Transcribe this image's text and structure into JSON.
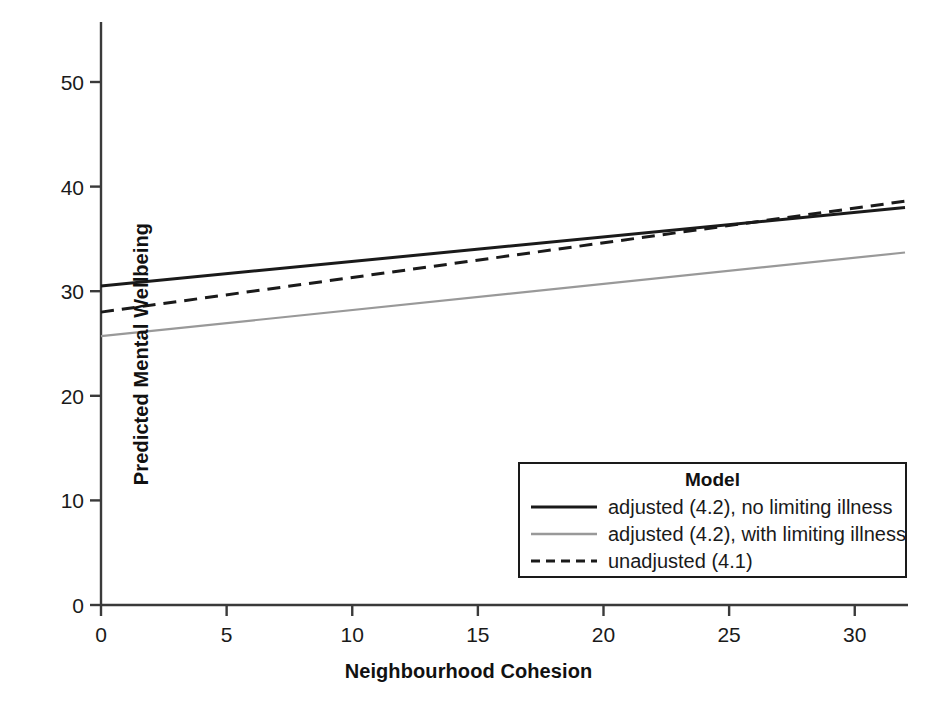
{
  "chart_data": {
    "type": "line",
    "title": "",
    "xlabel": "Neighbourhood Cohesion",
    "ylabel": "Predicted Mental Wellbeing",
    "xlim": [
      0,
      32
    ],
    "ylim": [
      0,
      55
    ],
    "xticks": [
      "0",
      "5",
      "10",
      "15",
      "20",
      "25",
      "30"
    ],
    "xtick_values": [
      0,
      5,
      10,
      15,
      20,
      25,
      30
    ],
    "yticks": [
      "0",
      "10",
      "20",
      "30",
      "40",
      "50"
    ],
    "ytick_values": [
      0,
      10,
      20,
      30,
      40,
      50
    ],
    "grid": false,
    "legend_position": "lower right",
    "legend_title": "Model",
    "series": [
      {
        "name": "adjusted (4.2), no limiting illness",
        "style": "solid",
        "color": "#1a1a1a",
        "width": 3,
        "x": [
          0,
          32
        ],
        "values": [
          30.5,
          38.0
        ]
      },
      {
        "name": "adjusted (4.2), with limiting illness",
        "style": "solid",
        "color": "#999999",
        "width": 2.2,
        "x": [
          0,
          32
        ],
        "values": [
          25.7,
          33.7
        ]
      },
      {
        "name": "unadjusted (4.1)",
        "style": "dashed",
        "color": "#1a1a1a",
        "width": 3,
        "x": [
          0,
          32
        ],
        "values": [
          28.0,
          38.6
        ]
      }
    ]
  },
  "axes": {
    "x_title": "Neighbourhood Cohesion",
    "y_title": "Predicted Mental Wellbeing"
  },
  "legend": {
    "title": "Model",
    "items": [
      {
        "label": "adjusted (4.2), no limiting illness",
        "style": "solid",
        "color": "#1a1a1a"
      },
      {
        "label": "adjusted (4.2), with limiting illness",
        "style": "solid",
        "color": "#999999"
      },
      {
        "label": "unadjusted (4.1)",
        "style": "dashed",
        "color": "#1a1a1a"
      }
    ]
  },
  "ticks": {
    "x": [
      {
        "label": "0",
        "value": 0
      },
      {
        "label": "5",
        "value": 5
      },
      {
        "label": "10",
        "value": 10
      },
      {
        "label": "15",
        "value": 15
      },
      {
        "label": "20",
        "value": 20
      },
      {
        "label": "25",
        "value": 25
      },
      {
        "label": "30",
        "value": 30
      }
    ],
    "y": [
      {
        "label": "0",
        "value": 0
      },
      {
        "label": "10",
        "value": 10
      },
      {
        "label": "20",
        "value": 20
      },
      {
        "label": "30",
        "value": 30
      },
      {
        "label": "40",
        "value": 40
      },
      {
        "label": "50",
        "value": 50
      }
    ]
  }
}
